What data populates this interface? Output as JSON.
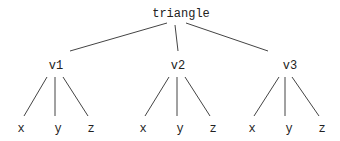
{
  "diagram": {
    "type": "tree",
    "root": {
      "id": "root",
      "label": "triangle",
      "x": 181,
      "y": 8
    },
    "internal": [
      {
        "id": "v1",
        "label": "v1",
        "x": 56,
        "y": 60
      },
      {
        "id": "v2",
        "label": "v2",
        "x": 178,
        "y": 60
      },
      {
        "id": "v3",
        "label": "v3",
        "x": 290,
        "y": 60
      }
    ],
    "leaves": [
      {
        "id": "v1x",
        "label": "x",
        "x": 21,
        "y": 123,
        "parent": "v1"
      },
      {
        "id": "v1y",
        "label": "y",
        "x": 58,
        "y": 123,
        "parent": "v1"
      },
      {
        "id": "v1z",
        "label": "z",
        "x": 91,
        "y": 123,
        "parent": "v1"
      },
      {
        "id": "v2x",
        "label": "x",
        "x": 143,
        "y": 123,
        "parent": "v2"
      },
      {
        "id": "v2y",
        "label": "y",
        "x": 180,
        "y": 123,
        "parent": "v2"
      },
      {
        "id": "v2z",
        "label": "z",
        "x": 213,
        "y": 123,
        "parent": "v2"
      },
      {
        "id": "v3x",
        "label": "x",
        "x": 252,
        "y": 123,
        "parent": "v3"
      },
      {
        "id": "v3y",
        "label": "y",
        "x": 289,
        "y": 123,
        "parent": "v3"
      },
      {
        "id": "v3z",
        "label": "z",
        "x": 322,
        "y": 123,
        "parent": "v3"
      }
    ],
    "edges": [
      {
        "from": "root",
        "to": "v1",
        "x1": 167,
        "y1": 23,
        "x2": 70,
        "y2": 51
      },
      {
        "from": "root",
        "to": "v2",
        "x1": 175,
        "y1": 25,
        "x2": 178,
        "y2": 51
      },
      {
        "from": "root",
        "to": "v3",
        "x1": 186,
        "y1": 23,
        "x2": 268,
        "y2": 51
      },
      {
        "from": "v1",
        "to": "v1x",
        "x1": 47,
        "y1": 77,
        "x2": 24,
        "y2": 116
      },
      {
        "from": "v1",
        "to": "v1y",
        "x1": 55,
        "y1": 77,
        "x2": 55,
        "y2": 116
      },
      {
        "from": "v1",
        "to": "v1z",
        "x1": 63,
        "y1": 77,
        "x2": 88,
        "y2": 116
      },
      {
        "from": "v2",
        "to": "v2x",
        "x1": 169,
        "y1": 77,
        "x2": 145,
        "y2": 116
      },
      {
        "from": "v2",
        "to": "v2y",
        "x1": 177,
        "y1": 77,
        "x2": 177,
        "y2": 116
      },
      {
        "from": "v2",
        "to": "v2z",
        "x1": 185,
        "y1": 77,
        "x2": 210,
        "y2": 116
      },
      {
        "from": "v3",
        "to": "v3x",
        "x1": 279,
        "y1": 77,
        "x2": 254,
        "y2": 116
      },
      {
        "from": "v3",
        "to": "v3y",
        "x1": 285,
        "y1": 77,
        "x2": 285,
        "y2": 116
      },
      {
        "from": "v3",
        "to": "v3z",
        "x1": 292,
        "y1": 77,
        "x2": 319,
        "y2": 116
      }
    ],
    "colors": {
      "line": "#444444",
      "text": "#222222",
      "background": "#ffffff"
    }
  }
}
